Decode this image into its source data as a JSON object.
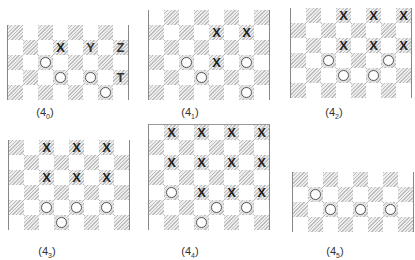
{
  "figure": {
    "cell_size": 15,
    "panels": [
      {
        "id": "4_0",
        "label": "(4",
        "subscript": "0",
        "label_close": ")",
        "x": 7,
        "y": 25,
        "cols": 8,
        "rows": 5,
        "hatch_parity": 0,
        "top_border": false,
        "label_x": 45,
        "label_y": 106,
        "pieces": [
          {
            "row": 1,
            "col": 3,
            "type": "X"
          },
          {
            "row": 1,
            "col": 5,
            "type": "Y"
          },
          {
            "row": 1,
            "col": 7,
            "type": "Z"
          },
          {
            "row": 2,
            "col": 2,
            "type": "O"
          },
          {
            "row": 3,
            "col": 3,
            "type": "O"
          },
          {
            "row": 3,
            "col": 5,
            "type": "O"
          },
          {
            "row": 3,
            "col": 7,
            "type": "T"
          },
          {
            "row": 4,
            "col": 6,
            "type": "O"
          }
        ]
      },
      {
        "id": "4_1",
        "label": "(4",
        "subscript": "1",
        "label_close": ")",
        "x": 148,
        "y": 10,
        "cols": 8,
        "rows": 6,
        "hatch_parity": 1,
        "top_border": false,
        "label_x": 190,
        "label_y": 106,
        "pieces": [
          {
            "row": 1,
            "col": 4,
            "type": "X"
          },
          {
            "row": 1,
            "col": 6,
            "type": "X"
          },
          {
            "row": 3,
            "col": 2,
            "type": "O"
          },
          {
            "row": 3,
            "col": 4,
            "type": "X"
          },
          {
            "row": 3,
            "col": 6,
            "type": "O"
          },
          {
            "row": 4,
            "col": 3,
            "type": "O"
          },
          {
            "row": 5,
            "col": 6,
            "type": "O"
          }
        ]
      },
      {
        "id": "4_2",
        "label": "(4",
        "subscript": "2",
        "label_close": ")",
        "x": 290,
        "y": 8,
        "cols": 8,
        "rows": 6,
        "hatch_parity": 1,
        "top_border": false,
        "label_x": 334,
        "label_y": 106,
        "pieces": [
          {
            "row": 0,
            "col": 3,
            "type": "X"
          },
          {
            "row": 0,
            "col": 5,
            "type": "X"
          },
          {
            "row": 0,
            "col": 7,
            "type": "X"
          },
          {
            "row": 2,
            "col": 3,
            "type": "X"
          },
          {
            "row": 2,
            "col": 5,
            "type": "X"
          },
          {
            "row": 2,
            "col": 7,
            "type": "X"
          },
          {
            "row": 3,
            "col": 2,
            "type": "O"
          },
          {
            "row": 3,
            "col": 6,
            "type": "O"
          },
          {
            "row": 4,
            "col": 3,
            "type": "O"
          },
          {
            "row": 4,
            "col": 5,
            "type": "O"
          }
        ]
      },
      {
        "id": "4_3",
        "label": "(4",
        "subscript": "3",
        "label_close": ")",
        "x": 8,
        "y": 140,
        "cols": 8,
        "rows": 6,
        "hatch_parity": 0,
        "top_border": false,
        "label_x": 47,
        "label_y": 245,
        "pieces": [
          {
            "row": 0,
            "col": 2,
            "type": "X"
          },
          {
            "row": 0,
            "col": 4,
            "type": "X"
          },
          {
            "row": 0,
            "col": 6,
            "type": "X"
          },
          {
            "row": 2,
            "col": 2,
            "type": "X"
          },
          {
            "row": 2,
            "col": 4,
            "type": "X"
          },
          {
            "row": 2,
            "col": 6,
            "type": "X"
          },
          {
            "row": 4,
            "col": 2,
            "type": "O"
          },
          {
            "row": 4,
            "col": 4,
            "type": "O"
          },
          {
            "row": 4,
            "col": 6,
            "type": "O"
          },
          {
            "row": 5,
            "col": 3,
            "type": "O"
          }
        ]
      },
      {
        "id": "4_4",
        "label": "(4",
        "subscript": "4",
        "label_close": ")",
        "x": 148,
        "y": 124,
        "cols": 8,
        "rows": 7,
        "hatch_parity": 1,
        "top_border": true,
        "label_x": 190,
        "label_y": 245,
        "pieces": [
          {
            "row": 0,
            "col": 1,
            "type": "X"
          },
          {
            "row": 0,
            "col": 3,
            "type": "X"
          },
          {
            "row": 0,
            "col": 5,
            "type": "X"
          },
          {
            "row": 0,
            "col": 7,
            "type": "X"
          },
          {
            "row": 2,
            "col": 1,
            "type": "X"
          },
          {
            "row": 2,
            "col": 3,
            "type": "X"
          },
          {
            "row": 2,
            "col": 5,
            "type": "X"
          },
          {
            "row": 2,
            "col": 7,
            "type": "X"
          },
          {
            "row": 4,
            "col": 1,
            "type": "O"
          },
          {
            "row": 4,
            "col": 3,
            "type": "X"
          },
          {
            "row": 4,
            "col": 5,
            "type": "X"
          },
          {
            "row": 4,
            "col": 7,
            "type": "X"
          },
          {
            "row": 5,
            "col": 4,
            "type": "O"
          },
          {
            "row": 5,
            "col": 6,
            "type": "O"
          },
          {
            "row": 6,
            "col": 3,
            "type": "O"
          }
        ]
      },
      {
        "id": "4_5",
        "label": "(4",
        "subscript": "5",
        "label_close": ")",
        "x": 292,
        "y": 172,
        "cols": 8,
        "rows": 4,
        "hatch_parity": 0,
        "top_border": false,
        "label_x": 335,
        "label_y": 245,
        "pieces": [
          {
            "row": 1,
            "col": 1,
            "type": "O"
          },
          {
            "row": 2,
            "col": 2,
            "type": "O"
          },
          {
            "row": 2,
            "col": 4,
            "type": "O"
          },
          {
            "row": 2,
            "col": 6,
            "type": "O"
          }
        ]
      }
    ]
  }
}
